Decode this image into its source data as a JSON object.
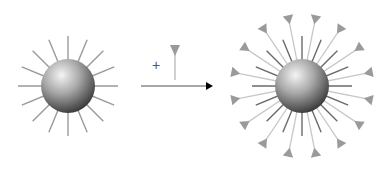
{
  "diagram": {
    "left_particle": {
      "center": [
        68,
        86
      ],
      "radius": 27,
      "spoke_count": 16,
      "spoke_length": 50,
      "spoke_color": "#9a9a9a"
    },
    "reagent": {
      "plus_label": "+",
      "glyph": "triangle-headed-ligand",
      "color": "#9a9a9a"
    },
    "arrow": {
      "from": [
        141,
        86
      ],
      "to": [
        213,
        86
      ],
      "line_color": "#8a8a8a",
      "head_color": "#000000"
    },
    "right_particle": {
      "center": [
        302,
        86
      ],
      "radius": 27,
      "inner_spoke_count": 16,
      "inner_spoke_length": 50,
      "inner_spoke_color": "#6a6a6a",
      "outer_ligand_count": 16,
      "outer_ligand_length": 70,
      "outer_ligand_color": "#c8c8c8",
      "triangle_color": "#9a9a9a"
    },
    "colors": {
      "sphere_highlight": "#f2f2f2",
      "sphere_mid": "#a0a0a0",
      "sphere_shadow": "#3a3a3a"
    }
  }
}
